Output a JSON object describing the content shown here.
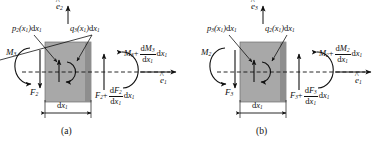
{
  "figure": {
    "type": "free-body-diagram-pair",
    "colors": {
      "element_fill": "#a8a8a8",
      "element_edge_dark": "#7a7a7a",
      "line": "#111111",
      "background": "#ffffff"
    }
  },
  "panels": [
    {
      "id": "a",
      "caption": "(a)",
      "unit_vector_vertical": "e",
      "unit_vector_vertical_sub": "2",
      "unit_vector_horizontal": "e",
      "unit_vector_horizontal_sub": "1",
      "load_left": {
        "symbol": "p",
        "sub": "2",
        "arg": "(x",
        "arg_sub": "1",
        "arg_end": ")",
        "d": "d",
        "dvar": "x",
        "dsub": "1"
      },
      "load_right": {
        "symbol": "q",
        "sub": "3",
        "arg": "(x",
        "arg_sub": "1",
        "arg_end": ")",
        "d": "d",
        "dvar": "x",
        "dsub": "1"
      },
      "moment_left": {
        "symbol": "M",
        "sub": "3"
      },
      "force_left": {
        "symbol": "F",
        "sub": "2"
      },
      "moment_right": {
        "symbol": "M",
        "sub": "3",
        "plus": "+",
        "num_d": "d",
        "num_sym": "M",
        "num_sub": "3",
        "den_d": "d",
        "den_sym": "x",
        "den_sub": "1",
        "tail_d": "d",
        "tail_sym": "x",
        "tail_sub": "1"
      },
      "force_right": {
        "symbol": "F",
        "sub": "2",
        "plus": "+",
        "num_d": "d",
        "num_sym": "F",
        "num_sub": "2",
        "den_d": "d",
        "den_sym": "x",
        "den_sub": "1",
        "tail_d": "d",
        "tail_sym": "x",
        "tail_sub": "1"
      },
      "dimension": {
        "d": "d",
        "sym": "x",
        "sub": "1"
      }
    },
    {
      "id": "b",
      "caption": "(b)",
      "unit_vector_vertical": "e",
      "unit_vector_vertical_sub": "3",
      "unit_vector_horizontal": "e",
      "unit_vector_horizontal_sub": "1",
      "load_left": {
        "symbol": "p",
        "sub": "3",
        "arg": "(x",
        "arg_sub": "1",
        "arg_end": ")",
        "d": "d",
        "dvar": "x",
        "dsub": "1"
      },
      "load_right": {
        "symbol": "q",
        "sub": "2",
        "arg": "(x",
        "arg_sub": "1",
        "arg_end": ")",
        "d": "d",
        "dvar": "x",
        "dsub": "1"
      },
      "moment_left": {
        "symbol": "M",
        "sub": "2"
      },
      "force_left": {
        "symbol": "F",
        "sub": "3"
      },
      "moment_right": {
        "symbol": "M",
        "sub": "2",
        "plus": "+",
        "num_d": "d",
        "num_sym": "M",
        "num_sub": "2",
        "den_d": "d",
        "den_sym": "x",
        "den_sub": "1",
        "tail_d": "d",
        "tail_sym": "x",
        "tail_sub": "1"
      },
      "force_right": {
        "symbol": "F",
        "sub": "3",
        "plus": "+",
        "num_d": "d",
        "num_sym": "F",
        "num_sub": "3",
        "den_d": "d",
        "den_sym": "x",
        "den_sub": "1",
        "tail_d": "d",
        "tail_sym": "x",
        "tail_sub": "1"
      },
      "dimension": {
        "d": "d",
        "sym": "x",
        "sub": "1"
      }
    }
  ]
}
